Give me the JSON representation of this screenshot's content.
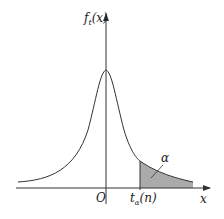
{
  "diagram": {
    "y_label": "f",
    "y_label_sub": "t",
    "y_label_tail": "(x)",
    "x_label": "x",
    "origin_label": "O",
    "quantile_label_main": "t",
    "quantile_label_sub": "α",
    "quantile_label_tail": "(n)",
    "area_label": "α",
    "colors": {
      "curve": "#333333",
      "shade": "#aaaaaa",
      "axis": "#333333"
    }
  }
}
